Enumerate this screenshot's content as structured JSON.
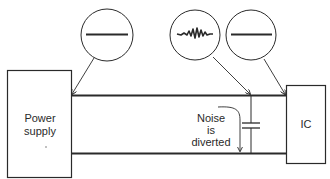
{
  "diagram": {
    "type": "circuit-decoupling",
    "colors": {
      "line": "#2a2a2a",
      "background": "#ffffff"
    },
    "blocks": {
      "power_supply": {
        "lines": [
          "Power",
          "supply"
        ]
      },
      "ic": {
        "label": "IC"
      }
    },
    "annotation": {
      "lines": [
        "Noise",
        "is",
        "diverted"
      ]
    },
    "callouts": [
      {
        "id": "supply-output",
        "signal": "clean-dc"
      },
      {
        "id": "rail-at-capacitor",
        "signal": "noisy"
      },
      {
        "id": "ic-input",
        "signal": "clean-dc"
      }
    ],
    "components": [
      {
        "type": "capacitor",
        "role": "decoupling"
      }
    ]
  }
}
